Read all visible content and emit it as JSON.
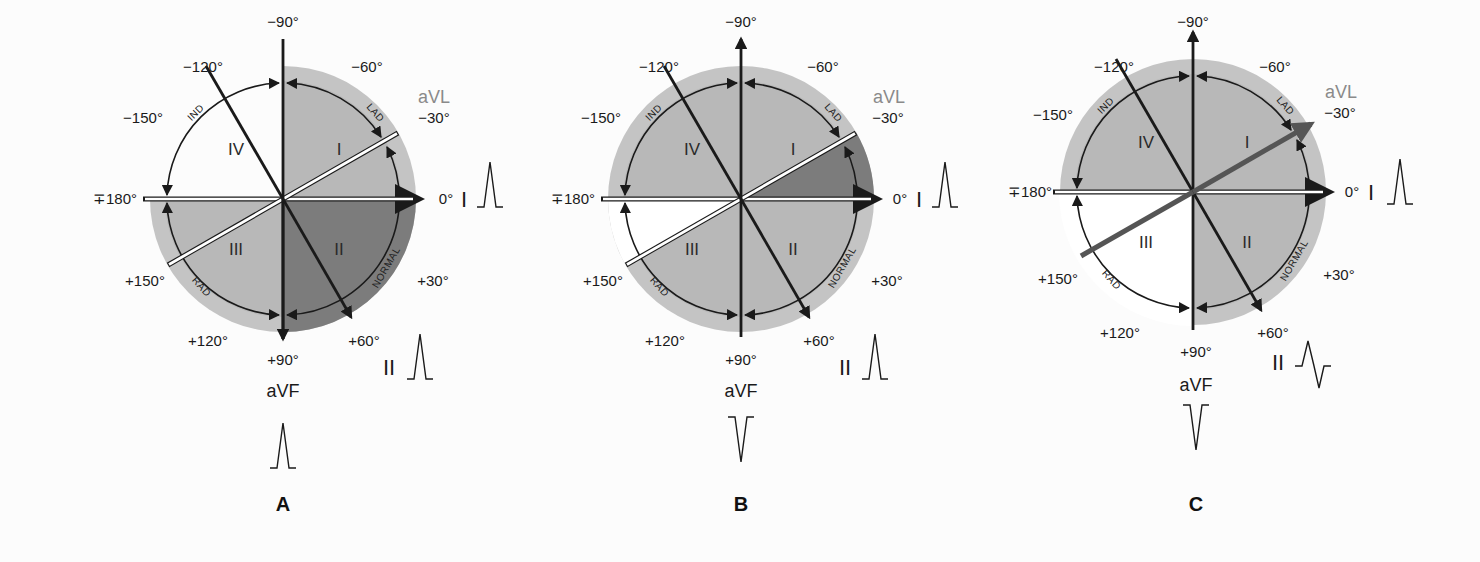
{
  "figure": {
    "colors": {
      "background": "#fcfcfc",
      "light_gray": "#c4c4c4",
      "medium_gray": "#b4b4b4",
      "dark_gray": "#7c7c7c",
      "white": "#ffffff",
      "line": "#1a1a1a",
      "avl_text": "#8a8a8a"
    },
    "angle_labels": {
      "m90": "−90°",
      "m60": "−60°",
      "m30": "−30°",
      "zero": "0°",
      "p30": "+30°",
      "p60": "+60°",
      "p90": "+90°",
      "p120": "+120°",
      "p150": "+150°",
      "pm180": "∓180°",
      "m150": "−150°",
      "m120": "−120°"
    },
    "quadrant_labels": {
      "q1": "I",
      "q2": "II",
      "q3": "III",
      "q4": "IV"
    },
    "arc_labels": {
      "lad": "LAD",
      "normal": "NORMAL",
      "rad": "RAD",
      "ind": "IND"
    },
    "lead_labels": {
      "lead_i": "I",
      "lead_ii": "II",
      "avl": "aVL",
      "avf": "aVF"
    },
    "panels": [
      {
        "id": "A",
        "label": "A",
        "lead_i_complex": "positive",
        "lead_ii_complex": "positive",
        "avf_complex": "positive",
        "axis_range": "0° to +90°",
        "highlighted_region": "normal quadrant (0° to +90°)"
      },
      {
        "id": "B",
        "label": "B",
        "lead_i_complex": "positive",
        "lead_ii_complex": "positive",
        "avf_complex": "negative",
        "axis_range": "0° to −30°",
        "highlighted_region": "0° to −30°"
      },
      {
        "id": "C",
        "label": "C",
        "lead_i_complex": "positive",
        "lead_ii_complex": "biphasic (equiphasic)",
        "avf_complex": "negative",
        "axis_range": "−30°",
        "highlighted_region": "aVL axis at −30°"
      }
    ]
  }
}
